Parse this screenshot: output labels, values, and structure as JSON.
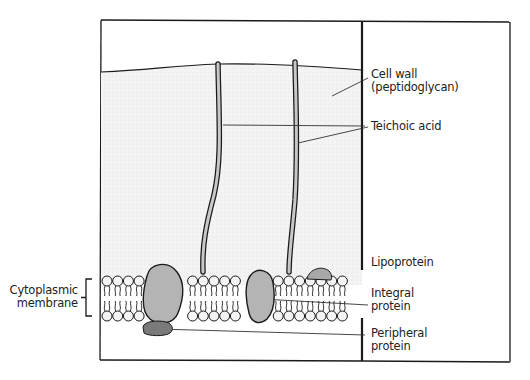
{
  "figure": {
    "type": "labeled biological diagram"
  },
  "labels": {
    "cell_wall_line1": "Cell wall",
    "cell_wall_line2": "(peptidoglycan)",
    "teichoic_acid": "Teichoic acid",
    "lipoprotein": "Lipoprotein",
    "integral_line1": "Integral",
    "integral_line2": "protein",
    "peripheral_line1": "Peripheral",
    "peripheral_line2": "protein",
    "cytoplasmic_line1": "Cytoplasmic",
    "cytoplasmic_line2": "membrane"
  },
  "colors": {
    "outline": "#1a1a1a",
    "wall_fill": "#f2f2f2",
    "rod_fill": "#c8c8c8",
    "integral_protein": "#b4b4b4",
    "peripheral_protein": "#7a7a7a",
    "lipoprotein": "#a8a8a8",
    "lipid_head": "#f4f4f4"
  }
}
